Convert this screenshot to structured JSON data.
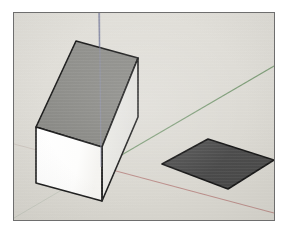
{
  "app": {
    "title": "3D Modeling Viewport",
    "kind": "sketchup-style-perspective-view"
  },
  "canvas": {
    "width": 287,
    "height": 234,
    "page_background": "#ffffff",
    "frame": {
      "x": 13,
      "y": 12,
      "width": 262,
      "height": 209,
      "border_color": "#6e6e6e",
      "border_width": 1
    },
    "background_color": "#dedcd6"
  },
  "axes": {
    "origin": {
      "x": 87,
      "y": 154
    },
    "blue_axis": {
      "name": "blue-vertical-axis",
      "color": "#7b7f9b",
      "label": "Z (blue) axis",
      "from": {
        "x": 85,
        "y": 0
      },
      "to": {
        "x": 87,
        "y": 154
      },
      "width": 1.3
    },
    "green_axis": {
      "name": "green-axis",
      "color": "#7a9a74",
      "label": "Y (green) axis",
      "from": {
        "x": 87,
        "y": 154
      },
      "to": {
        "x": 262,
        "y": 53
      },
      "width": 1.1
    },
    "green_axis_negative": {
      "name": "green-axis-negative",
      "color": "#b9c0b4",
      "from": {
        "x": 87,
        "y": 154
      },
      "to": {
        "x": 0,
        "y": 205
      },
      "width": 1.0
    },
    "red_axis": {
      "name": "red-axis",
      "color": "#b98a86",
      "label": "X (red) axis",
      "from": {
        "x": 87,
        "y": 154
      },
      "to": {
        "x": 262,
        "y": 200
      },
      "width": 1.1
    },
    "red_axis_negative": {
      "name": "red-axis-negative",
      "color": "#cbc3bc",
      "from": {
        "x": 87,
        "y": 154
      },
      "to": {
        "x": 0,
        "y": 131
      },
      "width": 1.0
    }
  },
  "objects": [
    {
      "name": "white-cube",
      "type": "cube",
      "label": "White cube",
      "faces": {
        "top": {
          "name": "cube-top-face",
          "fill": "#8b8b87",
          "points": "22,114 62,28 124,45 88,134"
        },
        "left": {
          "name": "cube-left-face",
          "fill": "#fdfdfc",
          "points": "22,114 88,134 88,188 22,170"
        },
        "right": {
          "name": "cube-right-face",
          "fill": "#e8e7e2",
          "points": "88,134 124,45 124,104 88,188"
        }
      },
      "edge_color": "#1c1c1c",
      "edge_width": 1.6,
      "vertical_seam_color": "#8a8a86"
    },
    {
      "name": "dark-rectangle-plate",
      "type": "rectangle-face",
      "label": "Dark gray rectangle",
      "fill": "#4b4b4b",
      "edge_color": "#161616",
      "edge_width": 1.6,
      "points": "148,151 194,126 262,147 214,176"
    }
  ],
  "colors": {
    "background": "#dedcd6",
    "frame_border": "#6e6e6e",
    "cube_white_face": "#fdfdfc",
    "cube_top_face": "#8b8b87",
    "cube_right_face": "#e8e7e2",
    "plate_fill": "#4b4b4b",
    "edge_stroke": "#1c1c1c",
    "axis_blue": "#7b7f9b",
    "axis_green": "#7a9a74",
    "axis_red": "#b98a86"
  }
}
